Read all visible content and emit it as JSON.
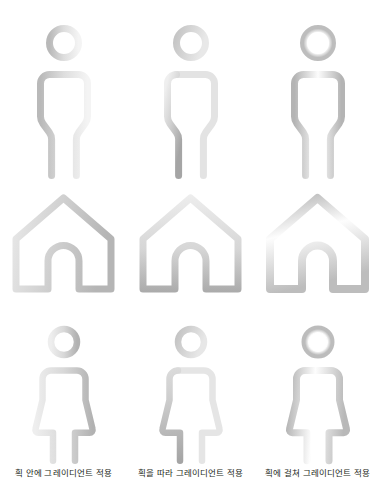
{
  "page": {
    "background_color": "#ffffff",
    "width": 381,
    "height": 496
  },
  "captions": [
    {
      "label": "획 안에 그레이디언트 적용"
    },
    {
      "label": "획을 따라 그레이디언트 적용"
    },
    {
      "label": "획에 걸쳐 그레이디언트 적용"
    }
  ],
  "gradient_modes": [
    {
      "id": "within-stroke",
      "name": "획 안에 그레이디언트 적용",
      "description": "Apply gradient within stroke",
      "stops": [
        "#bcbcbc",
        "#f2f2f2"
      ],
      "direction": "horizontal"
    },
    {
      "id": "along-stroke",
      "id_alt": "along",
      "name": "획을 따라 그레이디언트 적용",
      "description": "Apply gradient along stroke",
      "stops": [
        "#f0f0f0",
        "#a9a9a9"
      ],
      "direction": "path-length"
    },
    {
      "id": "across-stroke",
      "name": "획에 걸쳐 그레이디언트 적용",
      "description": "Apply gradient across stroke",
      "stops": [
        "#b4b4b4",
        "#fbfbfb",
        "#b4b4b4"
      ],
      "direction": "stroke-width"
    }
  ],
  "rows": [
    {
      "id": "row-male-figures",
      "icon": "male-figure-icon",
      "items": [
        {
          "name": "male-figure-gradient-within-stroke"
        },
        {
          "name": "male-figure-gradient-along-stroke"
        },
        {
          "name": "male-figure-gradient-across-stroke"
        }
      ]
    },
    {
      "id": "row-houses",
      "icon": "house-icon",
      "items": [
        {
          "name": "house-gradient-within-stroke"
        },
        {
          "name": "house-gradient-along-stroke"
        },
        {
          "name": "house-gradient-across-stroke"
        }
      ]
    },
    {
      "id": "row-female-figures",
      "icon": "female-figure-icon",
      "items": [
        {
          "name": "female-figure-gradient-within-stroke"
        },
        {
          "name": "female-figure-gradient-along-stroke"
        },
        {
          "name": "female-figure-gradient-across-stroke"
        }
      ]
    }
  ],
  "colors": {
    "stroke_light": "#f2f2f2",
    "stroke_mid": "#c8c8c8",
    "stroke_dark": "#a3a3a3",
    "caption_text": "#231f20"
  }
}
